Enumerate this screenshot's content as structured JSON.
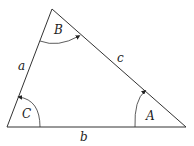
{
  "diagram": {
    "type": "triangle",
    "vertices": {
      "top": {
        "x": 52,
        "y": 9
      },
      "bottom_left": {
        "x": 7,
        "y": 127
      },
      "bottom_right": {
        "x": 186,
        "y": 127
      }
    },
    "angles": [
      {
        "name": "B",
        "label": "B",
        "at": "top"
      },
      {
        "name": "C",
        "label": "C",
        "at": "bottom_left"
      },
      {
        "name": "A",
        "label": "A",
        "at": "bottom_right"
      }
    ],
    "sides": [
      {
        "name": "a",
        "label": "a",
        "between": [
          "top",
          "bottom_left"
        ]
      },
      {
        "name": "b",
        "label": "b",
        "between": [
          "bottom_left",
          "bottom_right"
        ]
      },
      {
        "name": "c",
        "label": "c",
        "between": [
          "top",
          "bottom_right"
        ]
      }
    ],
    "colors": {
      "stroke": "#333333",
      "background": "#ffffff"
    }
  }
}
